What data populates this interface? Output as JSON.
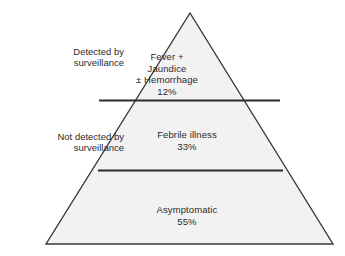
{
  "figure": {
    "type": "pyramid-diagram",
    "colors": {
      "fill": "#f2f2f2",
      "outline": "#3a3a3a",
      "divider": "#2b2b2b",
      "text": "#2b2b2b",
      "background": "#ffffff"
    }
  },
  "tiers": [
    {
      "id": "top",
      "name": "Fever + Jaundice ± Hemorrhage",
      "label": "Fever +\nJaundice\n± Hemorrhage",
      "percent": "12%",
      "value": 12,
      "surveillance": "Detected by surveillance"
    },
    {
      "id": "middle",
      "name": "Febrile illness",
      "label": "Febrile illness",
      "percent": "33%",
      "value": 33,
      "surveillance": "Not detected by surveillance"
    },
    {
      "id": "bottom",
      "name": "Asymptomatic",
      "label": "Asymptomatic",
      "percent": "55%",
      "value": 55,
      "surveillance": "Not detected by surveillance"
    }
  ],
  "side_labels": [
    {
      "id": "detected",
      "text": "Detected by\nsurveillance"
    },
    {
      "id": "not-detected",
      "text": "Not detected by\nsurveillance"
    }
  ]
}
